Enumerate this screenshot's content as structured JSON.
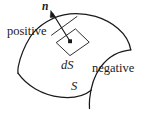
{
  "figure": {
    "type": "oriented-surface-diagram",
    "background_color": "#ffffff",
    "stroke_color": "#1a1a1a",
    "labels": {
      "normal_vector": "n",
      "positive_side": "positive",
      "negative_side": "negative",
      "area_element": "dS",
      "surface": "S"
    },
    "elements": {
      "surface_patch": "curved-saddle-surface",
      "area_element_shape": "parallelogram",
      "normal_arrow": "arrow-pointing-up-left",
      "base_point": "dot-at-parallelogram-center"
    }
  }
}
